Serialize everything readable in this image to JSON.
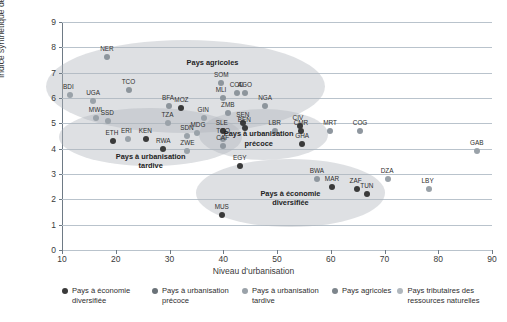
{
  "chart_data": {
    "type": "scatter",
    "title": "",
    "xlabel": "Niveau d'urbanisation",
    "ylabel": "Indice synthétique de fécondité",
    "xlim": [
      10,
      90
    ],
    "ylim": [
      0,
      9
    ],
    "xticks": [
      10,
      20,
      30,
      40,
      50,
      60,
      70,
      80,
      90
    ],
    "yticks": [
      0,
      1,
      2,
      3,
      4,
      5,
      6,
      7,
      8,
      9
    ],
    "grid": true,
    "legend_position": "bottom",
    "series": [
      {
        "name": "Pays à économie diversifiée",
        "color": "#3a3a3a",
        "points": [
          {
            "label": "ETH",
            "x": 19.4,
            "y": 4.3
          },
          {
            "label": "KEN",
            "x": 25.6,
            "y": 4.4
          },
          {
            "label": "RWA",
            "x": 28.8,
            "y": 4.0
          },
          {
            "label": "MOZ",
            "x": 32.2,
            "y": 5.6
          },
          {
            "label": "SEN",
            "x": 43.7,
            "y": 5.0
          },
          {
            "label": "BEN",
            "x": 44.0,
            "y": 4.8
          },
          {
            "label": "SLE",
            "x": 39.9,
            "y": 4.7
          },
          {
            "label": "CIV",
            "x": 54.2,
            "y": 4.9
          },
          {
            "label": "CMR",
            "x": 54.4,
            "y": 4.7
          },
          {
            "label": "GHA",
            "x": 54.7,
            "y": 4.2
          },
          {
            "label": "EGY",
            "x": 43.1,
            "y": 3.3
          },
          {
            "label": "MAR",
            "x": 60.2,
            "y": 2.5
          },
          {
            "label": "ZAF",
            "x": 64.8,
            "y": 2.4
          },
          {
            "label": "TUN",
            "x": 66.8,
            "y": 2.2
          },
          {
            "label": "MUS",
            "x": 39.7,
            "y": 1.4
          }
        ]
      },
      {
        "name": "Pays à urbanisation précoce",
        "color": "#8f979f",
        "points": [
          {
            "label": "TGO",
            "x": 40.0,
            "y": 4.4
          },
          {
            "label": "CAF",
            "x": 40.0,
            "y": 4.1
          },
          {
            "label": "LBR",
            "x": 49.7,
            "y": 4.7
          },
          {
            "label": "ZMB",
            "x": 40.9,
            "y": 5.4
          },
          {
            "label": "MRT",
            "x": 59.9,
            "y": 4.7
          },
          {
            "label": "COG",
            "x": 65.4,
            "y": 4.7
          },
          {
            "label": "BWA",
            "x": 57.4,
            "y": 2.8
          }
        ]
      },
      {
        "name": "Pays à urbanisation tardive",
        "color": "#9aa2a9",
        "points": [
          {
            "label": "BDI",
            "x": 11.5,
            "y": 6.1
          },
          {
            "label": "UGA",
            "x": 15.8,
            "y": 5.9
          },
          {
            "label": "MWI",
            "x": 16.3,
            "y": 5.2
          },
          {
            "label": "SSD",
            "x": 18.5,
            "y": 5.1
          },
          {
            "label": "ERI",
            "x": 22.3,
            "y": 4.4
          },
          {
            "label": "TZA",
            "x": 29.8,
            "y": 5.0
          },
          {
            "label": "SDN",
            "x": 33.3,
            "y": 4.5
          },
          {
            "label": "MDG",
            "x": 35.2,
            "y": 4.6
          },
          {
            "label": "ZWE",
            "x": 33.3,
            "y": 3.9
          },
          {
            "label": "GIN",
            "x": 36.5,
            "y": 5.2
          }
        ]
      },
      {
        "name": "Pays agricoles",
        "color": "#8d959c",
        "points": [
          {
            "label": "NER",
            "x": 18.4,
            "y": 7.6
          },
          {
            "label": "TCO",
            "x": 22.4,
            "y": 6.3
          },
          {
            "label": "BFA",
            "x": 29.9,
            "y": 5.7
          },
          {
            "label": "SOM",
            "x": 39.6,
            "y": 6.6
          },
          {
            "label": "MLI",
            "x": 39.9,
            "y": 6.0
          },
          {
            "label": "COD",
            "x": 42.5,
            "y": 6.2
          },
          {
            "label": "AGO",
            "x": 44.0,
            "y": 6.2
          },
          {
            "label": "NGA",
            "x": 47.8,
            "y": 5.7
          }
        ]
      },
      {
        "name": "Pays tributaires des ressources naturelles",
        "color": "#9aa2a9",
        "points": [
          {
            "label": "GAB",
            "x": 87.2,
            "y": 3.9
          },
          {
            "label": "DZA",
            "x": 70.6,
            "y": 2.8
          },
          {
            "label": "LBY",
            "x": 78.2,
            "y": 2.4
          }
        ]
      }
    ],
    "annotations": [
      {
        "text": "Pays agricoles",
        "x": 38.0,
        "y": 7.25
      },
      {
        "text": "Pays à urbanisation tardive",
        "x": 26.5,
        "y": 3.55
      },
      {
        "text": "Pays à urbanisation précoce",
        "x": 46.6,
        "y": 4.45
      },
      {
        "text": "Pays à économie diversifiée",
        "x": 52.5,
        "y": 2.1
      }
    ],
    "clusters": [
      {
        "name": "agricoles-ellipse",
        "cx": 33.0,
        "cy": 6.45,
        "rx": 26.0,
        "ry": 1.85
      },
      {
        "name": "urbanisation-tardive-ellipse",
        "cx": 26.5,
        "cy": 4.45,
        "rx": 17.0,
        "ry": 1.15
      },
      {
        "name": "urbanisation-precoce-ellipse",
        "cx": 47.5,
        "cy": 4.55,
        "rx": 12.0,
        "ry": 1.0
      },
      {
        "name": "economie-diversifiee-ellipse",
        "cx": 52.5,
        "cy": 2.25,
        "rx": 17.5,
        "ry": 1.35
      }
    ]
  },
  "axis": {
    "ylabel": "Indice synthétique de fécondité",
    "xlabel": "Niveau d'urbanisation"
  },
  "legend": {
    "items": [
      {
        "label": "Pays à économie diversifiée",
        "color": "#3a3a3a"
      },
      {
        "label": "Pays à urbanisation précoce",
        "color": "#6a7278"
      },
      {
        "label": "Pays à urbanisation tardive",
        "color": "#9aa2a9"
      },
      {
        "label": "Pays agricoles",
        "color": "#7d858c"
      },
      {
        "label": "Pays tributaires des ressources naturelles",
        "color": "#b0b7bd"
      }
    ]
  }
}
